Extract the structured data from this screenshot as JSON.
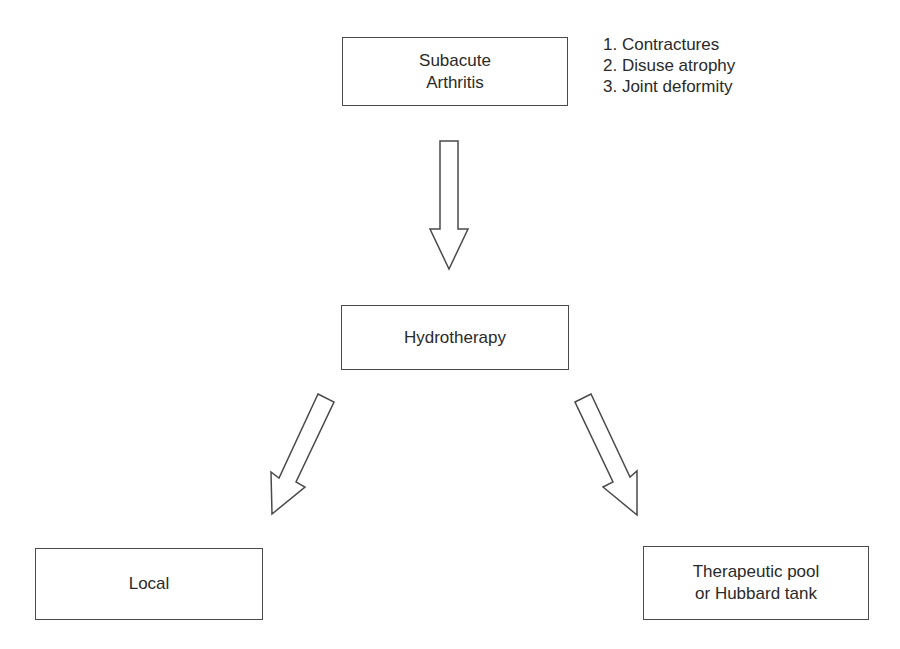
{
  "diagram": {
    "type": "flowchart",
    "nodes": {
      "subacute": {
        "line1": "Subacute",
        "line2": "Arthritis"
      },
      "hydrotherapy": {
        "label": "Hydrotherapy"
      },
      "local": {
        "label": "Local"
      },
      "pool": {
        "line1": "Therapeutic pool",
        "line2": "or Hubbard tank"
      }
    },
    "complications": [
      "1. Contractures",
      "2. Disuse atrophy",
      "3. Joint deformity"
    ],
    "edges": [
      {
        "from": "Subacute Arthritis",
        "to": "Hydrotherapy",
        "style": "hollow-block-arrow"
      },
      {
        "from": "Hydrotherapy",
        "to": "Local",
        "style": "hollow-block-arrow"
      },
      {
        "from": "Hydrotherapy",
        "to": "Therapeutic pool or Hubbard tank",
        "style": "hollow-block-arrow"
      }
    ],
    "colors": {
      "stroke": "#4a4a4a",
      "text": "#2a2a2a",
      "background": "#ffffff"
    }
  }
}
